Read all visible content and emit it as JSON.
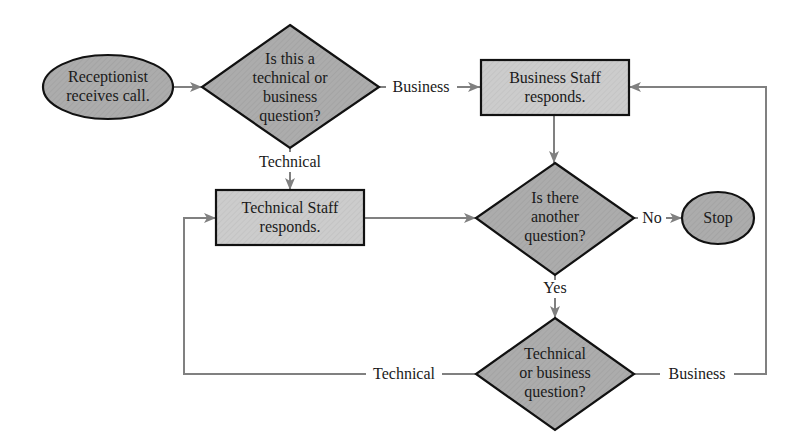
{
  "diagram": {
    "type": "flowchart",
    "colors": {
      "node_fill": "#a9a9a9",
      "box_fill": "#c9c9c9",
      "node_stroke": "#111111",
      "edge": "#808080",
      "text": "#1a1a1a"
    },
    "nodes": {
      "start": {
        "shape": "ellipse",
        "lines": [
          "Receptionist",
          "receives call."
        ]
      },
      "decision1": {
        "shape": "diamond",
        "lines": [
          "Is this a",
          "technical or",
          "business",
          "question?"
        ]
      },
      "business_staff": {
        "shape": "rectangle",
        "lines": [
          "Business Staff",
          "responds."
        ]
      },
      "technical_staff": {
        "shape": "rectangle",
        "lines": [
          "Technical Staff",
          "responds."
        ]
      },
      "decision2": {
        "shape": "diamond",
        "lines": [
          "Is there",
          "another",
          "question?"
        ]
      },
      "stop": {
        "shape": "ellipse",
        "lines": [
          "Stop"
        ]
      },
      "decision3": {
        "shape": "diamond",
        "lines": [
          "Technical",
          "or business",
          "question?"
        ]
      }
    },
    "edges": [
      {
        "from": "start",
        "to": "decision1",
        "label": ""
      },
      {
        "from": "decision1",
        "to": "business_staff",
        "label": "Business"
      },
      {
        "from": "decision1",
        "to": "technical_staff",
        "label": "Technical"
      },
      {
        "from": "business_staff",
        "to": "decision2",
        "label": ""
      },
      {
        "from": "technical_staff",
        "to": "decision2",
        "label": ""
      },
      {
        "from": "decision2",
        "to": "stop",
        "label": "No"
      },
      {
        "from": "decision2",
        "to": "decision3",
        "label": "Yes"
      },
      {
        "from": "decision3",
        "to": "technical_staff",
        "label": "Technical"
      },
      {
        "from": "decision3",
        "to": "business_staff",
        "label": "Business"
      }
    ],
    "edge_labels": {
      "d1_business": "Business",
      "d1_technical": "Technical",
      "d2_no": "No",
      "d2_yes": "Yes",
      "d3_technical": "Technical",
      "d3_business": "Business"
    }
  }
}
